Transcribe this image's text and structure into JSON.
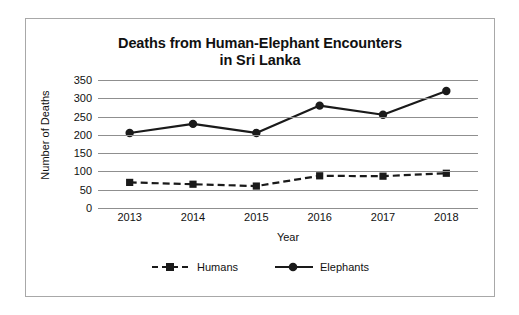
{
  "chart_data": {
    "type": "line",
    "title": "Deaths from Human-Elephant Encounters in Sri Lanka",
    "title_lines": [
      "Deaths from Human-Elephant Encounters",
      "in Sri Lanka"
    ],
    "xlabel": "Year",
    "ylabel": "Number of Deaths",
    "categories": [
      "2013",
      "2014",
      "2015",
      "2016",
      "2017",
      "2018"
    ],
    "x": [
      2013,
      2014,
      2015,
      2016,
      2017,
      2018
    ],
    "ylim": [
      0,
      350
    ],
    "ytick_labels": [
      "0",
      "50",
      "100",
      "150",
      "200",
      "250",
      "300",
      "350"
    ],
    "yticks": [
      0,
      50,
      100,
      150,
      200,
      250,
      300,
      350
    ],
    "grid": "horizontal",
    "legend_position": "bottom",
    "series": [
      {
        "name": "Humans",
        "values": [
          70,
          65,
          60,
          88,
          87,
          95
        ],
        "line_style": "dashed",
        "marker": "square",
        "color": "#1a1a1a"
      },
      {
        "name": "Elephants",
        "values": [
          205,
          230,
          205,
          280,
          255,
          320
        ],
        "line_style": "solid",
        "marker": "circle",
        "color": "#1a1a1a"
      }
    ]
  },
  "legend": {
    "items": [
      {
        "label": "Humans"
      },
      {
        "label": "Elephants"
      }
    ]
  },
  "colors": {
    "series": "#1a1a1a",
    "gridline": "#8f8f8f",
    "frame": "#a8a8a8",
    "text": "#111111"
  }
}
